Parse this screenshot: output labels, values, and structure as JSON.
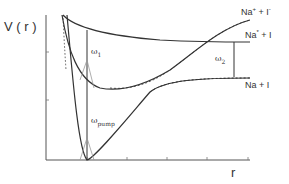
{
  "axes": {
    "y_label": "V ( r )",
    "x_label": "r"
  },
  "states": {
    "ionic": {
      "base": "Na",
      "sup1": "+",
      "mid": " + I",
      "sup2": "-"
    },
    "excited": {
      "base": "Na",
      "sup1": "*",
      "mid": " + I",
      "sup2": ""
    },
    "ground": {
      "base": "Na",
      "sup1": "",
      "mid": " + I",
      "sup2": ""
    }
  },
  "transitions": {
    "omega1": {
      "symbol": "ω",
      "sub": "1"
    },
    "omega2": {
      "symbol": "ω",
      "sub": "2"
    },
    "omega_pump": {
      "symbol": "ω",
      "sub": "pump"
    }
  },
  "colors": {
    "curve": "#333333",
    "axis": "#555555",
    "pulse": "#999999",
    "text": "#333333"
  }
}
